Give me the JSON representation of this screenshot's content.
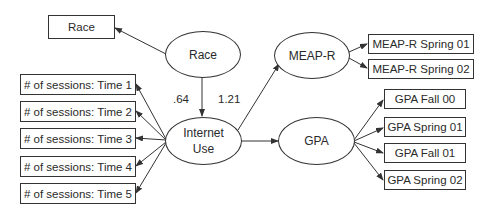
{
  "diagram": {
    "latent": {
      "race": "Race",
      "internet_use_line1": "Internet",
      "internet_use_line2": "Use",
      "meap_r": "MEAP-R",
      "gpa": "GPA"
    },
    "observed": {
      "race": "Race",
      "sessions": [
        "# of sessions: Time 1",
        "# of sessions: Time 2",
        "# of sessions: Time 3",
        "# of sessions: Time 4",
        "# of sessions: Time 5"
      ],
      "meap": [
        "MEAP-R Spring 01",
        "MEAP-R Spring 02"
      ],
      "gpa": [
        "GPA Fall 00",
        "GPA Spring 01",
        "GPA Fall 01",
        "GPA Spring 02"
      ]
    },
    "coefficients": {
      "race_to_internet": ".64",
      "internet_to_meap": "1.21"
    },
    "colors": {
      "line": "#333333",
      "text": "#2a2a2a",
      "background": "#ffffff"
    }
  }
}
